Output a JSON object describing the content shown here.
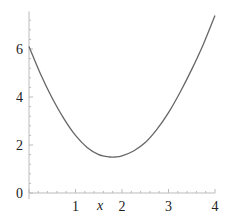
{
  "chart_data": {
    "type": "line",
    "title": "",
    "xlabel": "x",
    "ylabel": "",
    "xlim": [
      0,
      4
    ],
    "ylim": [
      0,
      7.4
    ],
    "grid": false,
    "legend": null,
    "x_ticks": [
      {
        "value": 1,
        "label": "1"
      },
      {
        "value": 2,
        "label": "2"
      },
      {
        "value": 3,
        "label": "3"
      },
      {
        "value": 4,
        "label": "4"
      }
    ],
    "y_ticks": [
      {
        "value": 0,
        "label": "0"
      },
      {
        "value": 2,
        "label": "2"
      },
      {
        "value": 4,
        "label": "4"
      },
      {
        "value": 6,
        "label": "6"
      }
    ],
    "series": [
      {
        "name": "f(x)",
        "color": "#666666",
        "x": [
          0,
          0.25,
          0.5,
          0.75,
          1.0,
          1.25,
          1.5,
          1.75,
          1.85,
          2.0,
          2.25,
          2.5,
          2.75,
          3.0,
          3.25,
          3.5,
          3.75,
          4.0
        ],
        "y": [
          6.1,
          4.95,
          3.95,
          3.1,
          2.4,
          1.9,
          1.6,
          1.5,
          1.5,
          1.55,
          1.75,
          2.1,
          2.65,
          3.35,
          4.2,
          5.15,
          6.2,
          7.4
        ]
      }
    ]
  }
}
